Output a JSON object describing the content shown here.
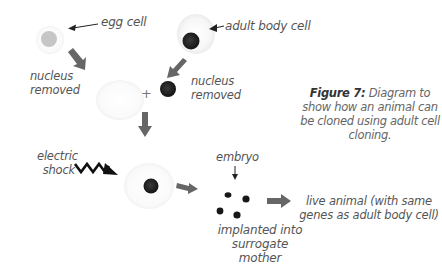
{
  "figure": {
    "number_label": "Figure 7:",
    "caption": "Diagram to show how an animal can be cloned using adult cell cloning."
  },
  "labels": {
    "egg_cell": "egg cell",
    "adult_body_cell": "adult body cell",
    "nucleus_removed_left_line1": "nucleus",
    "nucleus_removed_left_line2": "removed",
    "nucleus_removed_right_line1": "nucleus",
    "nucleus_removed_right_line2": "removed",
    "plus": "+",
    "electric_shock_line1": "electric",
    "electric_shock_line2": "shock",
    "embryo": "embryo",
    "implanted_line1": "implanted into",
    "implanted_line2": "surrogate mother",
    "live_animal_line1": "live animal (with same",
    "live_animal_line2": "genes as adult body cell)"
  },
  "colors": {
    "arrow_fill": "#666666",
    "nucleus_dark": "#222222",
    "egg_nucleus": "#c4c4c4",
    "text": "#555555"
  }
}
